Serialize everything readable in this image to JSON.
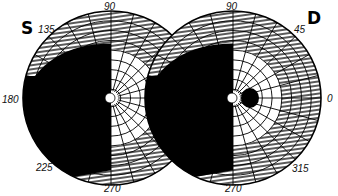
{
  "figure": {
    "type": "visual field perimetry chart (Goldmann)",
    "left_eye": {
      "label": "S",
      "center": [
        111,
        98
      ],
      "radius": 88,
      "meridian_labels": {
        "deg90": "90",
        "deg135": "135",
        "deg180": "180",
        "deg225": "225",
        "deg270": "270"
      },
      "defect": "left hemifield blacked out (temporal field loss)"
    },
    "right_eye": {
      "label": "D",
      "center": [
        233,
        98
      ],
      "radius": 88,
      "meridian_labels": {
        "deg90": "90",
        "deg45": "45",
        "deg0": "0",
        "deg315": "315",
        "deg270": "270"
      },
      "defect": "left hemifield blacked out (nasal field loss) plus blind spot to the right of fixation"
    },
    "ring_count": 9,
    "meridian_step_deg": 15,
    "colors": {
      "ink": "#000000",
      "paper": "#ffffff"
    }
  }
}
